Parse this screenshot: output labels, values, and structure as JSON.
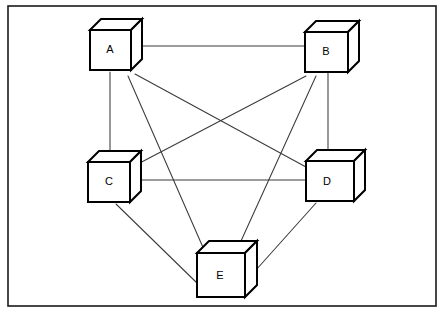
{
  "canvas": {
    "width": 447,
    "height": 315,
    "background_color": "#ffffff"
  },
  "frame": {
    "x": 8,
    "y": 6,
    "width": 428,
    "height": 300,
    "stroke_color": "#1a1a1a",
    "stroke_width": 1.6
  },
  "style": {
    "node_stroke_color": "#000000",
    "node_fill_color": "#ffffff",
    "node_stroke_width": 2,
    "edge_stroke_color": "#3a3a3a",
    "edge_stroke_width": 1.05,
    "label_color": "#000000",
    "label_font_size": 11
  },
  "diagram": {
    "type": "network-topology",
    "shape": "complete-graph",
    "node_count": 5,
    "edge_count": 10,
    "node_glyph": "3d-cube",
    "nodes": [
      {
        "id": "A",
        "label": "A",
        "x": 90,
        "y": 30,
        "width": 41,
        "height": 40,
        "depth": 11,
        "label_x": 110,
        "label_y": 50
      },
      {
        "id": "B",
        "label": "B",
        "x": 305,
        "y": 32,
        "width": 43,
        "height": 40,
        "depth": 11,
        "label_x": 326,
        "label_y": 52
      },
      {
        "id": "C",
        "label": "C",
        "x": 88,
        "y": 162,
        "width": 42,
        "height": 40,
        "depth": 11,
        "label_x": 109,
        "label_y": 182
      },
      {
        "id": "D",
        "label": "D",
        "x": 306,
        "y": 161,
        "width": 48,
        "height": 40,
        "depth": 11,
        "label_x": 327,
        "label_y": 182
      },
      {
        "id": "E",
        "label": "E",
        "x": 197,
        "y": 253,
        "width": 48,
        "height": 44,
        "depth": 12,
        "label_x": 220,
        "label_y": 276
      }
    ],
    "edges": [
      {
        "from": "A",
        "to": "B",
        "x1": 133,
        "y1": 46,
        "x2": 305,
        "y2": 46
      },
      {
        "from": "A",
        "to": "C",
        "x1": 110,
        "y1": 72,
        "x2": 110,
        "y2": 163
      },
      {
        "from": "A",
        "to": "D",
        "x1": 135,
        "y1": 74,
        "x2": 306,
        "y2": 167
      },
      {
        "from": "A",
        "to": "E",
        "x1": 128,
        "y1": 76,
        "x2": 205,
        "y2": 252
      },
      {
        "from": "B",
        "to": "C",
        "x1": 306,
        "y1": 76,
        "x2": 134,
        "y2": 166
      },
      {
        "from": "B",
        "to": "D",
        "x1": 328,
        "y1": 73,
        "x2": 328,
        "y2": 162
      },
      {
        "from": "B",
        "to": "E",
        "x1": 316,
        "y1": 76,
        "x2": 236,
        "y2": 252
      },
      {
        "from": "C",
        "to": "D",
        "x1": 131,
        "y1": 180,
        "x2": 306,
        "y2": 180
      },
      {
        "from": "C",
        "to": "E",
        "x1": 116,
        "y1": 204,
        "x2": 197,
        "y2": 283
      },
      {
        "from": "D",
        "to": "E",
        "x1": 316,
        "y1": 203,
        "x2": 247,
        "y2": 280
      }
    ]
  }
}
